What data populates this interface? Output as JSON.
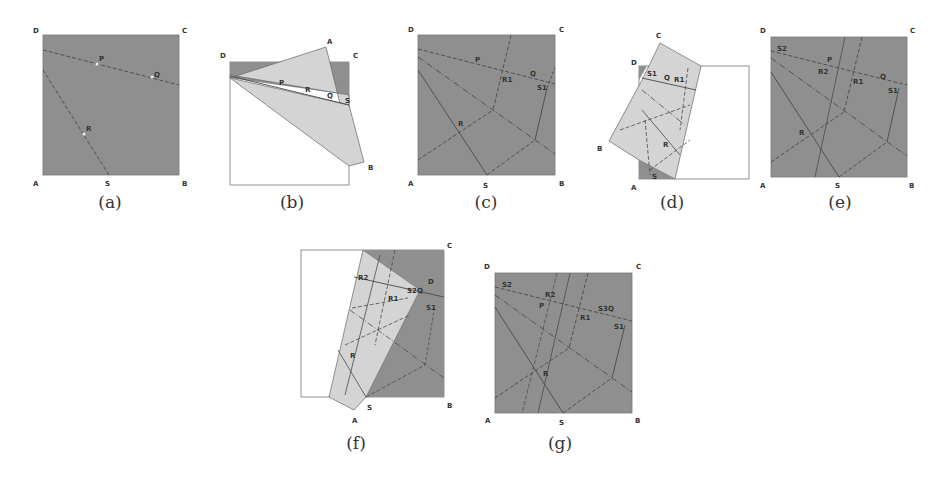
{
  "figure": {
    "colors": {
      "dark_fill": "#8f8f8f",
      "light_fill": "#d4d4d4",
      "line": "#4a4a4a",
      "outline": "#777777",
      "bg": "#ffffff"
    },
    "panels": [
      {
        "id": "a",
        "caption": "(a)",
        "labels": {
          "D": "D",
          "C": "C",
          "A": "A",
          "B": "B",
          "P": "P",
          "Q": "Q",
          "R": "R",
          "S": "S"
        }
      },
      {
        "id": "b",
        "caption": "(b)",
        "labels": {
          "D": "D",
          "C": "C",
          "A": "A",
          "B": "B",
          "P": "P",
          "R": "R",
          "Q": "Q",
          "S": "S"
        }
      },
      {
        "id": "c",
        "caption": "(c)",
        "labels": {
          "D": "D",
          "C": "C",
          "A": "A",
          "B": "B",
          "P": "P",
          "Q": "Q",
          "R1": "R1",
          "S1": "S1",
          "R": "R",
          "S": "S"
        }
      },
      {
        "id": "d",
        "caption": "(d)",
        "labels": {
          "C": "C",
          "D": "D",
          "S1": "S1",
          "Q": "Q",
          "R1": "R1",
          "B": "B",
          "R": "R",
          "A": "A",
          "S": "S"
        }
      },
      {
        "id": "e",
        "caption": "(e)",
        "labels": {
          "D": "D",
          "C": "C",
          "S2": "S2",
          "P": "P",
          "R2": "R2",
          "R1": "R1",
          "Q": "Q",
          "S1": "S1",
          "R": "R",
          "A": "A",
          "S": "S",
          "B": "B"
        }
      },
      {
        "id": "f",
        "caption": "(f)",
        "labels": {
          "C": "C",
          "R2": "R2",
          "D": "D",
          "S2Q": "S2Q",
          "R1": "R1",
          "S1": "S1",
          "R": "R",
          "S": "S",
          "A": "A",
          "B": "B"
        }
      },
      {
        "id": "g",
        "caption": "(g)",
        "labels": {
          "D": "D",
          "C": "C",
          "S2": "S2",
          "R2": "R2",
          "P": "P",
          "R1": "R1",
          "S3Q": "S3Q",
          "S1": "S1",
          "R": "R",
          "A": "A",
          "S": "S",
          "B": "B"
        }
      }
    ]
  }
}
